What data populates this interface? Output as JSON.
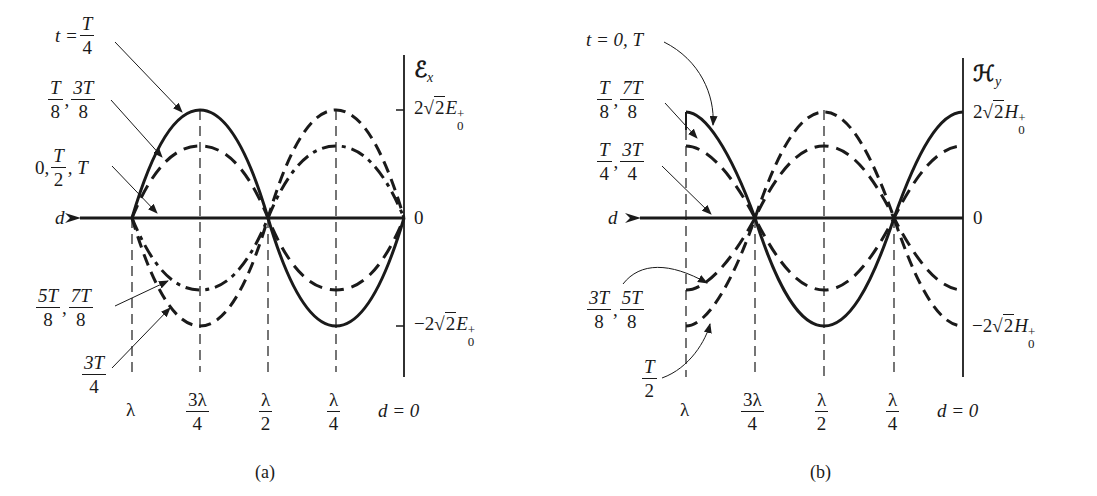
{
  "figure": {
    "panels": [
      {
        "id": "a",
        "caption": "(a)",
        "y_axis_symbol": "ℰ",
        "y_axis_subscript": "x",
        "y_top_value": "2√2 E0+",
        "y_top_coef": "2",
        "y_top_radicand": "2",
        "y_top_var": "E",
        "y_top_sub": "0",
        "y_top_sup": "+",
        "y_zero": "0",
        "y_bottom_coef": "−2",
        "y_bottom_radicand": "2",
        "y_bottom_var": "E",
        "y_bottom_sub": "0",
        "y_bottom_sup": "+",
        "x_axis_var": "d",
        "x_ticks": [
          {
            "num": "λ",
            "den": ""
          },
          {
            "num": "3λ",
            "den": "4"
          },
          {
            "num": "λ",
            "den": "2"
          },
          {
            "num": "λ",
            "den": "4"
          }
        ],
        "x_origin": "d = 0",
        "curve_labels": {
          "t_quarter": {
            "prefix": "t =",
            "num": "T",
            "den": "4"
          },
          "t_eighth": {
            "a_num": "T",
            "a_den": "8",
            "b_num": "3T",
            "b_den": "8"
          },
          "t_zero": {
            "prefix": "0,",
            "num": "T",
            "den": "2",
            "suffix": ", T"
          },
          "t_five_eighth": {
            "a_num": "5T",
            "a_den": "8",
            "b_num": "7T",
            "b_den": "8"
          },
          "t_three_quarter": {
            "num": "3T",
            "den": "4"
          }
        }
      },
      {
        "id": "b",
        "caption": "(b)",
        "y_axis_symbol": "ℋ",
        "y_axis_subscript": "y",
        "y_top_value": "2√2 H0+",
        "y_top_coef": "2",
        "y_top_radicand": "2",
        "y_top_var": "H",
        "y_top_sub": "0",
        "y_top_sup": "+",
        "y_zero": "0",
        "y_bottom_coef": "−2",
        "y_bottom_radicand": "2",
        "y_bottom_var": "H",
        "y_bottom_sub": "0",
        "y_bottom_sup": "+",
        "x_axis_var": "d",
        "x_ticks": [
          {
            "num": "λ",
            "den": ""
          },
          {
            "num": "3λ",
            "den": "4"
          },
          {
            "num": "λ",
            "den": "2"
          },
          {
            "num": "λ",
            "den": "4"
          }
        ],
        "x_origin": "d = 0",
        "curve_labels": {
          "t_zero": {
            "prefix": "t = 0,",
            "suffix": "T"
          },
          "t_eighth": {
            "a_num": "T",
            "a_den": "8",
            "b_num": "7T",
            "b_den": "8"
          },
          "t_quarter": {
            "a_num": "T",
            "a_den": "4",
            "b_num": "3T",
            "b_den": "4"
          },
          "t_three_eighth": {
            "a_num": "3T",
            "a_den": "8",
            "b_num": "5T",
            "b_den": "8"
          },
          "t_half": {
            "num": "T",
            "den": "2"
          }
        }
      }
    ]
  }
}
